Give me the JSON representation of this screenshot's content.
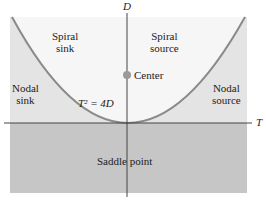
{
  "diagram": {
    "axes": {
      "x_label": "T",
      "y_label": "D"
    },
    "curve_label": "T² = 4D",
    "regions": {
      "spiral_sink": [
        "Spiral",
        "sink"
      ],
      "spiral_source": [
        "Spiral",
        "source"
      ],
      "nodal_sink": [
        "Nodal",
        "sink"
      ],
      "nodal_source": [
        "Nodal",
        "source"
      ],
      "saddle": "Saddle point",
      "center": "Center"
    },
    "colors": {
      "light_region": "#e4e4e4",
      "dark_region": "#c4c4c4",
      "inner_region": "#f4f4f4",
      "curve": "#8a8a8a",
      "axis": "#444444",
      "center_dot": "#9a9a9a"
    }
  }
}
